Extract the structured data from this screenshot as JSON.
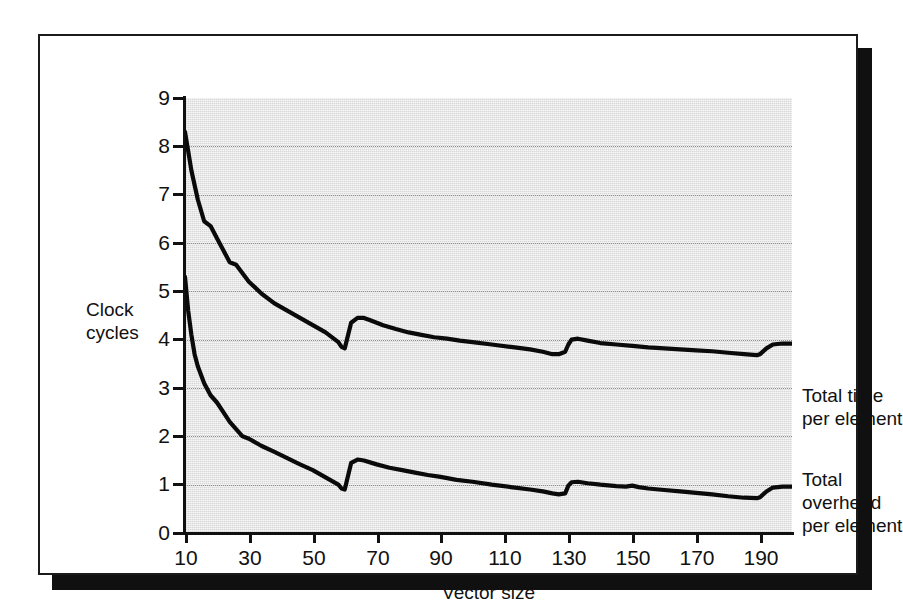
{
  "figure": {
    "kind": "scanned-chart-figure",
    "background_color": "#ffffff",
    "frame_color": "#1b1b1b",
    "shadow_color": "#101010",
    "plot_background_color": "#d8d8d8",
    "curve_color": "#0a0a0a",
    "gridline_color": "#8d8d8d"
  },
  "chart_data": {
    "type": "line",
    "title": "",
    "subtitle": "",
    "xlabel": "Vector size",
    "ylabel": "Clock cycles",
    "xlim": [
      10,
      200
    ],
    "ylim": [
      0,
      9
    ],
    "grid": true,
    "grid_style": "dotted horizontal gridlines at each integer y tick",
    "legend_position": "right-of-plot inline labels",
    "xticks": [
      10,
      30,
      50,
      70,
      90,
      110,
      130,
      150,
      170,
      190
    ],
    "xticklabels": [
      "10",
      "30",
      "50",
      "70",
      "90",
      "110",
      "130",
      "150",
      "170",
      "190"
    ],
    "yticks": [
      0,
      1,
      2,
      3,
      4,
      5,
      6,
      7,
      8,
      9
    ],
    "yticklabels": [
      "0",
      "1",
      "2",
      "3",
      "4",
      "5",
      "6",
      "7",
      "8",
      "9"
    ],
    "series": [
      {
        "name": "Total time per element",
        "label_lines": [
          "Total time",
          "per element"
        ],
        "x": [
          10,
          12,
          14,
          16,
          18,
          20,
          22,
          24,
          26,
          30,
          34,
          38,
          42,
          46,
          50,
          54,
          58,
          59,
          60,
          62,
          64,
          66,
          68,
          72,
          76,
          80,
          84,
          88,
          92,
          96,
          100,
          106,
          112,
          118,
          122,
          125,
          127,
          129,
          130,
          131,
          133,
          136,
          140,
          145,
          150,
          155,
          160,
          165,
          170,
          175,
          180,
          185,
          189,
          190,
          192,
          194,
          197,
          200
        ],
        "y": [
          8.3,
          7.5,
          6.9,
          6.45,
          6.35,
          6.1,
          5.85,
          5.6,
          5.55,
          5.2,
          4.95,
          4.75,
          4.6,
          4.45,
          4.3,
          4.15,
          3.95,
          3.85,
          3.82,
          4.35,
          4.45,
          4.45,
          4.4,
          4.3,
          4.22,
          4.15,
          4.1,
          4.05,
          4.02,
          3.98,
          3.95,
          3.9,
          3.85,
          3.8,
          3.75,
          3.7,
          3.7,
          3.75,
          3.9,
          4.0,
          4.02,
          3.98,
          3.93,
          3.9,
          3.87,
          3.84,
          3.82,
          3.8,
          3.78,
          3.76,
          3.73,
          3.7,
          3.68,
          3.7,
          3.82,
          3.9,
          3.92,
          3.92
        ]
      },
      {
        "name": "Total overhead per element",
        "label_lines": [
          "Total",
          "overhead",
          "per element"
        ],
        "x": [
          10,
          11,
          12,
          13,
          14,
          16,
          18,
          20,
          22,
          24,
          26,
          28,
          30,
          34,
          38,
          42,
          46,
          50,
          54,
          58,
          59,
          60,
          62,
          64,
          66,
          70,
          74,
          78,
          82,
          86,
          90,
          95,
          100,
          106,
          112,
          118,
          122,
          125,
          127,
          129,
          130,
          131,
          133,
          136,
          140,
          145,
          148,
          150,
          152,
          155,
          160,
          165,
          170,
          175,
          180,
          185,
          189,
          190,
          192,
          194,
          197,
          200
        ],
        "y": [
          5.3,
          4.6,
          4.1,
          3.7,
          3.45,
          3.1,
          2.85,
          2.7,
          2.5,
          2.3,
          2.15,
          2.0,
          1.95,
          1.8,
          1.68,
          1.55,
          1.42,
          1.3,
          1.15,
          1.0,
          0.92,
          0.9,
          1.45,
          1.52,
          1.5,
          1.42,
          1.35,
          1.3,
          1.25,
          1.2,
          1.16,
          1.1,
          1.06,
          1.0,
          0.95,
          0.9,
          0.86,
          0.82,
          0.8,
          0.82,
          0.98,
          1.05,
          1.06,
          1.03,
          1.0,
          0.97,
          0.96,
          0.98,
          0.95,
          0.92,
          0.89,
          0.86,
          0.83,
          0.8,
          0.76,
          0.73,
          0.72,
          0.74,
          0.86,
          0.94,
          0.96,
          0.96
        ]
      }
    ],
    "annotations": [
      "Upper curve falls steeply from 8.3 at vector size 10 to about 3.85 near size 59, then jumps up to about 4.45 and decays slowly toward 3.7, with a smaller jump near size 130 and a final rise near 190.",
      "Lower curve falls from about 5.3 at vector size 10 to about 0.9 near size 59, jumps to about 1.5, decays to about 0.8 near size 127, small jump near 130, then decays to about 0.72 before rising near 190."
    ]
  }
}
